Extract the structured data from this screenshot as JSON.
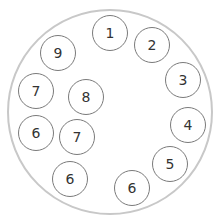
{
  "colors": {
    "outer_stroke": "#c8c8c8",
    "node_stroke": "#7a7a7a",
    "text": "#333333",
    "background": "#ffffff"
  },
  "outer_circle": {
    "cx": 110,
    "cy": 112,
    "r": 103
  },
  "node_radius": 18,
  "nodes": [
    {
      "label": "1",
      "cx": 110,
      "cy": 33
    },
    {
      "label": "2",
      "cx": 152,
      "cy": 45
    },
    {
      "label": "3",
      "cx": 183,
      "cy": 80
    },
    {
      "label": "4",
      "cx": 188,
      "cy": 125
    },
    {
      "label": "5",
      "cx": 170,
      "cy": 164
    },
    {
      "label": "6",
      "cx": 132,
      "cy": 188
    },
    {
      "label": "6",
      "cx": 70,
      "cy": 179
    },
    {
      "label": "7",
      "cx": 77,
      "cy": 137
    },
    {
      "label": "6",
      "cx": 36,
      "cy": 133
    },
    {
      "label": "7",
      "cx": 36,
      "cy": 91
    },
    {
      "label": "8",
      "cx": 86,
      "cy": 97
    },
    {
      "label": "9",
      "cx": 58,
      "cy": 53
    }
  ]
}
